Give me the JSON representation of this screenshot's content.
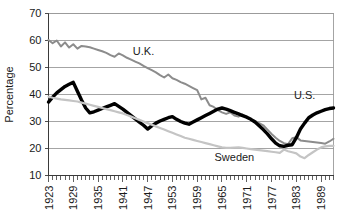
{
  "chart_data": {
    "type": "line",
    "title": "",
    "xlabel": "",
    "ylabel": "Percentage",
    "ylim": [
      10,
      70
    ],
    "xlim": [
      1923,
      1992
    ],
    "yticks": [
      10,
      20,
      30,
      40,
      50,
      60,
      70
    ],
    "xtick_labels": [
      "1923",
      "1929",
      "1935",
      "1941",
      "1947",
      "1953",
      "1959",
      "1965",
      "1971",
      "1977",
      "1983",
      "1989"
    ],
    "xtick_years": [
      1923,
      1929,
      1935,
      1941,
      1947,
      1953,
      1959,
      1965,
      1971,
      1977,
      1983,
      1989
    ],
    "minor_tick_interval": 1,
    "grid": "horizontal",
    "legend_position": "inline-annotations",
    "x": [
      1923,
      1924,
      1925,
      1926,
      1927,
      1928,
      1929,
      1930,
      1931,
      1932,
      1933,
      1934,
      1935,
      1936,
      1937,
      1938,
      1939,
      1940,
      1941,
      1942,
      1943,
      1944,
      1945,
      1946,
      1947,
      1948,
      1949,
      1950,
      1951,
      1952,
      1953,
      1954,
      1955,
      1956,
      1957,
      1958,
      1959,
      1960,
      1961,
      1962,
      1963,
      1964,
      1965,
      1966,
      1967,
      1968,
      1969,
      1970,
      1971,
      1972,
      1973,
      1974,
      1975,
      1976,
      1977,
      1978,
      1979,
      1980,
      1981,
      1982,
      1983,
      1984,
      1985,
      1986,
      1987,
      1988,
      1989,
      1990,
      1991,
      1992
    ],
    "series": [
      {
        "name": "U.K.",
        "color": "#8c8c8c",
        "line_width": 2.0,
        "label_x": 1946,
        "label_y": 54.5,
        "values": [
          60.2,
          59.0,
          60.0,
          57.8,
          59.3,
          57.4,
          58.6,
          57.0,
          58.0,
          57.8,
          57.5,
          57.0,
          56.5,
          56.0,
          55.4,
          54.6,
          54.0,
          55.2,
          54.5,
          53.6,
          52.9,
          52.2,
          51.5,
          50.6,
          49.8,
          49.0,
          48.2,
          47.2,
          46.3,
          47.4,
          46.0,
          45.4,
          44.6,
          44.0,
          43.2,
          42.4,
          41.6,
          38.2,
          38.8,
          36.0,
          35.4,
          34.2,
          33.4,
          32.8,
          33.4,
          32.2,
          31.8,
          32.6,
          31.4,
          30.8,
          30.2,
          29.4,
          28.6,
          27.0,
          25.4,
          24.0,
          22.8,
          22.0,
          21.6,
          23.8,
          24.2,
          23.0,
          22.8,
          22.6,
          22.4,
          22.2,
          22.0,
          21.8,
          22.6,
          23.6
        ]
      },
      {
        "name": "U.S.",
        "color": "#000000",
        "line_width": 3.4,
        "label_x": 1985,
        "label_y": 38.5,
        "values": [
          37.2,
          39.0,
          40.6,
          41.8,
          43.0,
          43.8,
          44.5,
          41.2,
          38.0,
          35.0,
          33.2,
          33.6,
          34.2,
          34.8,
          35.4,
          36.0,
          36.6,
          35.6,
          34.6,
          33.4,
          32.2,
          31.0,
          29.8,
          28.6,
          27.2,
          28.4,
          29.4,
          30.2,
          30.8,
          31.4,
          31.8,
          30.8,
          30.0,
          29.4,
          29.0,
          29.8,
          30.6,
          31.4,
          32.2,
          33.0,
          33.8,
          34.6,
          35.0,
          34.6,
          34.0,
          33.4,
          32.8,
          32.2,
          31.6,
          30.8,
          29.8,
          28.4,
          27.0,
          25.4,
          23.6,
          22.0,
          21.0,
          20.8,
          21.2,
          21.4,
          24.0,
          27.2,
          29.4,
          31.4,
          32.4,
          33.2,
          33.8,
          34.4,
          34.8,
          35.0
        ]
      },
      {
        "name": "Sweden",
        "color": "#c4c4c4",
        "line_width": 2.2,
        "label_x": 1968,
        "label_y": 15.5,
        "values": [
          39.2,
          38.8,
          38.5,
          38.2,
          38.0,
          37.8,
          37.6,
          37.4,
          37.0,
          36.6,
          36.2,
          35.8,
          35.4,
          35.0,
          34.6,
          34.2,
          33.8,
          33.4,
          33.0,
          32.4,
          31.8,
          31.2,
          30.6,
          30.0,
          29.4,
          28.8,
          28.2,
          27.6,
          27.0,
          26.4,
          25.8,
          25.2,
          24.6,
          24.0,
          23.6,
          23.2,
          22.8,
          22.4,
          22.0,
          21.6,
          21.2,
          20.8,
          20.4,
          20.2,
          20.2,
          20.3,
          20.4,
          20.2,
          20.0,
          19.8,
          19.6,
          19.4,
          19.2,
          19.0,
          18.8,
          18.6,
          18.4,
          19.6,
          19.0,
          18.6,
          18.2,
          17.0,
          16.4,
          17.6,
          18.6,
          19.6,
          20.4,
          20.8,
          21.0,
          21.0
        ]
      }
    ]
  }
}
